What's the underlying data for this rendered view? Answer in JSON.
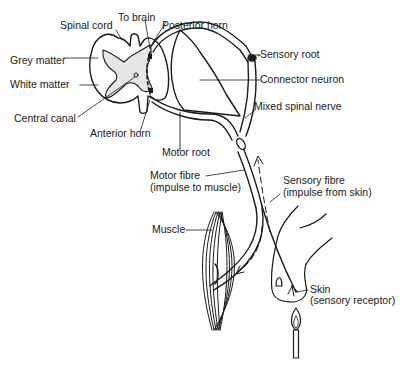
{
  "diagram": {
    "labels": {
      "spinal_cord": "Spinal cord",
      "to_brain": "To brain",
      "posterior_horn": "Posterior horn",
      "grey_matter": "Grey matter",
      "white_matter": "White matter",
      "central_canal": "Central canal",
      "anterior_horn": "Anterior horn",
      "sensory_root": "Sensory root",
      "connector_neuron": "Connector neuron",
      "mixed_spinal_nerve": "Mixed spinal nerve",
      "motor_root": "Motor root",
      "motor_fibre_line1": "Motor fibre",
      "motor_fibre_line2": "(impulse to muscle)",
      "sensory_fibre_line1": "Sensory fibre",
      "sensory_fibre_line2": "(impulse from skin)",
      "muscle": "Muscle",
      "skin_line1": "Skin",
      "skin_line2": "(sensory receptor)"
    },
    "colors": {
      "ink": "#1a1a1a",
      "grey_matter_fill": "#e4e4e4",
      "background": "#ffffff"
    }
  }
}
